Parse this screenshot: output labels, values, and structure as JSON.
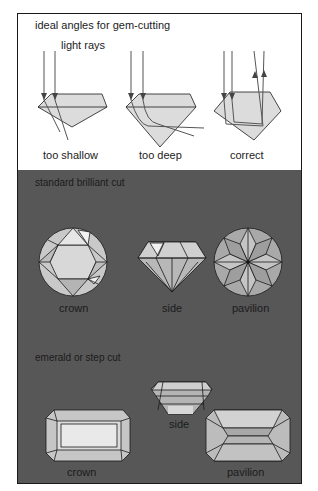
{
  "angles_panel": {
    "title": "ideal angles for gem-cutting",
    "ray_label": "light rays",
    "diagrams": [
      {
        "label": "too shallow"
      },
      {
        "label": "too deep"
      },
      {
        "label": "correct"
      }
    ]
  },
  "brilliant_panel": {
    "title": "standard brilliant cut",
    "views": [
      {
        "label": "crown"
      },
      {
        "label": "side"
      },
      {
        "label": "pavilion"
      }
    ]
  },
  "emerald_panel": {
    "title": "emerald or step cut",
    "views": [
      {
        "label": "side"
      },
      {
        "label": "crown"
      },
      {
        "label": "pavilion"
      }
    ]
  },
  "colors": {
    "background_dark": "#575757",
    "background_light": "#ffffff",
    "gem_fill": "#d9d9d9",
    "gem_light": "#ececec",
    "gem_mid": "#b8b8b8",
    "outline": "#1a1a1a",
    "ray": "#555555"
  }
}
